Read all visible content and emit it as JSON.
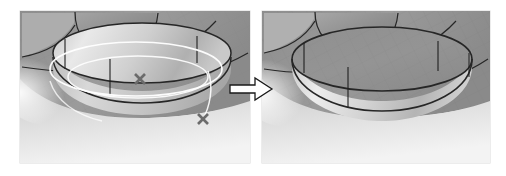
{
  "figure": {
    "type": "cad-before-after-comparison",
    "caption": "",
    "panels": [
      {
        "id": "before",
        "label": "before",
        "description": "3D CAD shaded model of a circular boss on a filleted surface with selected construction circles highlighted in white and two point markers",
        "viewport_bg_top": "#9a9a9a",
        "viewport_bg_bottom": "#f2f2f2",
        "markers": [
          {
            "name": "point-marker-center",
            "symbol": "×",
            "x": 140,
            "y": 79,
            "color": "#6b6b6b"
          },
          {
            "name": "point-marker-edge",
            "symbol": "×",
            "x": 203,
            "y": 119,
            "color": "#6b6b6b"
          }
        ],
        "highlight_color": "#ffffff",
        "edge_color": "#2b2b2b"
      },
      {
        "id": "after",
        "label": "after",
        "description": "3D CAD shaded model of the same circular boss after the operation, with construction geometry and point markers removed",
        "viewport_bg_top": "#9a9a9a",
        "viewport_bg_bottom": "#f2f2f2",
        "markers": [],
        "highlight_color": "#ffffff",
        "edge_color": "#2b2b2b"
      }
    ],
    "connector": {
      "name": "right-arrow",
      "direction": "right",
      "fill": "#ffffff",
      "stroke": "#1a1a1a"
    },
    "colors": {
      "solid_top_face": "#8f8f8f",
      "solid_side_light": "#dcdcdc",
      "solid_side_mid": "#b6b6b6",
      "solid_side_dark": "#9c9c9c",
      "grid_line": "#7d7d7d",
      "outline": "#262626",
      "page_background": "#ffffff"
    }
  }
}
